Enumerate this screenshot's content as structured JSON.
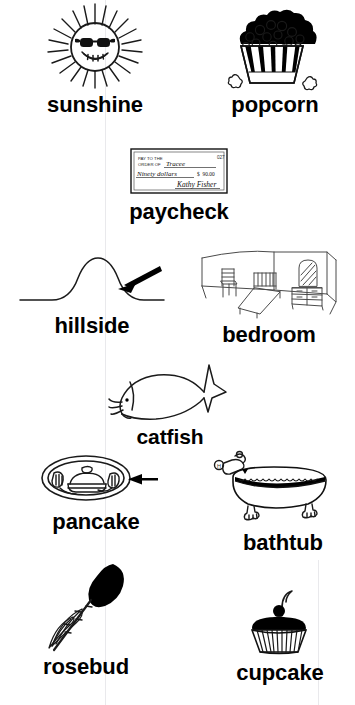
{
  "page": {
    "kind": "vocabulary-picture-worksheet",
    "background_color": "#ffffff",
    "ink_color": "#111111",
    "label_color": "#000000"
  },
  "items": [
    {
      "id": "sunshine",
      "label": "sunshine",
      "icon": "sun-with-sunglasses-icon",
      "description": "Smiling sun wearing dark sunglasses with radiating rays"
    },
    {
      "id": "popcorn",
      "label": "popcorn",
      "icon": "popcorn-bucket-icon",
      "description": "Striped popcorn tub overflowing with popped kernels"
    },
    {
      "id": "paycheck",
      "label": "paycheck",
      "icon": "bank-check-icon",
      "description": "Handwritten bank check",
      "check": {
        "number": "027",
        "pay_to_the_order_of_label": "PAY TO THE ORDER OF",
        "payee": "Tracee",
        "written_amount": "Ninety dollars",
        "currency_symbol": "$",
        "numeric_amount": "90.00",
        "signature": "Kathy Fisher"
      }
    },
    {
      "id": "hillside",
      "label": "hillside",
      "icon": "hill-with-arrow-icon",
      "description": "Rounded hill on a horizon line with an arrow pointing to its side slope"
    },
    {
      "id": "bedroom",
      "label": "bedroom",
      "icon": "bedroom-interior-icon",
      "description": "Room corner with a chair, a bed and a dresser with mirror"
    },
    {
      "id": "catfish",
      "label": "catfish",
      "icon": "catfish-icon",
      "description": "Outline fish with whiskers and forked tail"
    },
    {
      "id": "pancake",
      "label": "pancake",
      "icon": "pancake-plate-icon",
      "description": "Oval plate of stacked pancakes with butter, arrow pointing at it"
    },
    {
      "id": "bathtub",
      "label": "bathtub",
      "icon": "clawfoot-bathtub-icon",
      "description": "Clawfoot tub with faucet and filled water line"
    },
    {
      "id": "rosebud",
      "label": "rosebud",
      "icon": "rosebud-icon",
      "description": "Unopened rose bud on a thorny stem with leaves"
    },
    {
      "id": "cupcake",
      "label": "cupcake",
      "icon": "cupcake-icon",
      "description": "Cupcake in ridged liner with frosting and a cherry on top"
    }
  ]
}
